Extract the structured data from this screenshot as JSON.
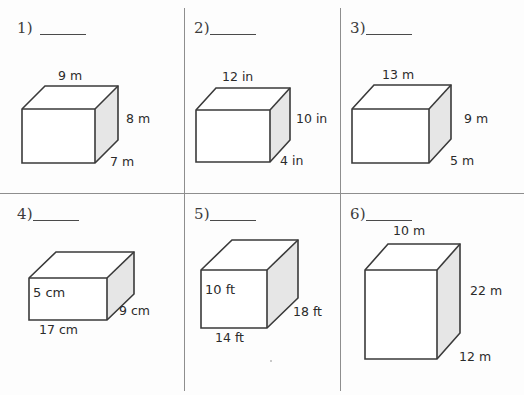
{
  "worksheet": {
    "layout": {
      "columns": 3,
      "rows": 2,
      "unit_note": "mixed units"
    },
    "problems": [
      {
        "number": "1)",
        "blank": "",
        "shape": "rectangular-prism",
        "dimensions": {
          "top": "9 m",
          "right": "8 m",
          "depth": "7 m"
        }
      },
      {
        "number": "2)",
        "blank": "",
        "shape": "rectangular-prism",
        "dimensions": {
          "top": "12 in",
          "right": "10 in",
          "depth": "4 in"
        }
      },
      {
        "number": "3)",
        "blank": "",
        "shape": "rectangular-prism",
        "dimensions": {
          "top": "13 m",
          "right": "9 m",
          "depth": "5 m"
        }
      },
      {
        "number": "4)",
        "blank": "",
        "shape": "rectangular-prism",
        "dimensions": {
          "height": "5 cm",
          "bottom": "17 cm",
          "depth": "9 cm"
        }
      },
      {
        "number": "5)",
        "blank": "",
        "shape": "rectangular-prism",
        "dimensions": {
          "height": "10 ft",
          "bottom": "14 ft",
          "depth": "18 ft"
        }
      },
      {
        "number": "6)",
        "blank": "",
        "shape": "rectangular-prism",
        "dimensions": {
          "top": "10 m",
          "right": "22 m",
          "depth": "12 m"
        }
      }
    ],
    "colors": {
      "edge": "#3a3a3a",
      "side_face": "#e6e6e6",
      "front_face": "#ffffff",
      "divider": "#8e8e8e",
      "text": "#2b2b2b"
    }
  }
}
